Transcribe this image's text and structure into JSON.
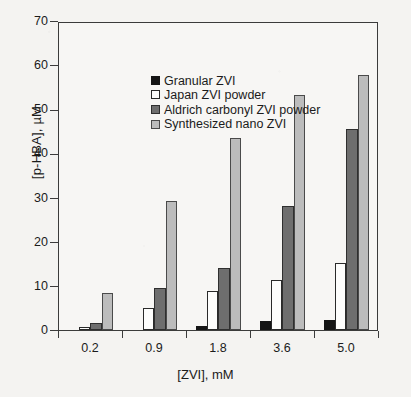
{
  "chart_data": {
    "type": "bar",
    "title": "",
    "xlabel": "[ZVI], mM",
    "ylabel": "[p-HBA], µM",
    "categories": [
      "0.2",
      "0.9",
      "1.8",
      "3.6",
      "5.0"
    ],
    "ylim": [
      0,
      70
    ],
    "yticks": [
      "0",
      "10",
      "20",
      "30",
      "40",
      "50",
      "60",
      "70"
    ],
    "ytick_values": [
      0,
      10,
      20,
      30,
      40,
      50,
      60,
      70
    ],
    "grid": false,
    "legend_position": "upper-left inside axes",
    "series": [
      {
        "name": "Granular ZVI",
        "color": "#151515",
        "values": [
          0.0,
          0.0,
          1.0,
          2.1,
          2.3
        ]
      },
      {
        "name": "Japan ZVI powder",
        "color": "#fdfdfc",
        "values": [
          0.6,
          5.1,
          8.9,
          11.4,
          15.2
        ]
      },
      {
        "name": "Aldrich carbonyl ZVI powder",
        "color": "#6e6e6e",
        "values": [
          1.5,
          9.6,
          14.0,
          28.1,
          45.6
        ]
      },
      {
        "name": "Synthesized nano ZVI",
        "color": "#bcbcbc",
        "values": [
          8.3,
          29.3,
          43.4,
          53.3,
          57.8
        ]
      }
    ]
  },
  "legend": {
    "items": [
      {
        "label": "Granular ZVI",
        "swatch": "#151515"
      },
      {
        "label": "Japan ZVI powder",
        "swatch": "#fdfdfc"
      },
      {
        "label": "Aldrich carbonyl ZVI powder",
        "swatch": "#6e6e6e"
      },
      {
        "label": "Synthesized nano ZVI",
        "swatch": "#bcbcbc"
      }
    ]
  }
}
